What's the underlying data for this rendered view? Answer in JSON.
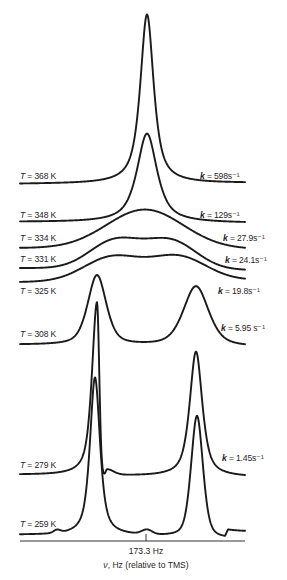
{
  "figure": {
    "background": "#ffffff",
    "line_color": "#1a1a1a"
  },
  "chart_data": {
    "type": "line",
    "subtype": "stacked NMR spectra vs temperature (two-site exchange)",
    "title": "",
    "xlabel_symbol": "ν",
    "xlabel_rest": ", Hz (relative to TMS)",
    "xlabel": "ν, Hz (relative to TMS)",
    "ylabel": "",
    "grid": false,
    "legend": "inline labels (temperature left, rate constant right)",
    "units_note": "x positions and intensities given in figure pixel units (no numeric y axis shown)",
    "x_range_px": [
      20,
      245
    ],
    "x_ticks": [
      {
        "x_px": 146,
        "label": "173.3 Hz"
      }
    ],
    "temperature_symbol": "T",
    "rate_symbol": "k",
    "series": [
      {
        "name": "T = 368 K",
        "T_K": 368,
        "k_s-1": 598,
        "T_label": " = 368 K",
        "k_label": " = 598s⁻¹",
        "baseline": [
          [
            20,
            184
          ],
          [
            245,
            183
          ]
        ],
        "peaks": [
          {
            "x": 147,
            "h": 169,
            "w": 8,
            "eta": 0.8
          }
        ]
      },
      {
        "name": "T = 348 K",
        "T_K": 348,
        "k_s-1": 129,
        "T_label": " = 348 K",
        "k_label": " = 129s⁻¹",
        "baseline": [
          [
            20,
            222
          ],
          [
            245,
            223
          ]
        ],
        "peaks": [
          {
            "x": 147,
            "h": 89,
            "w": 12,
            "eta": 0.8
          }
        ]
      },
      {
        "name": "T = 334 K",
        "T_K": 334,
        "k_s-1": 27.9,
        "T_label": " = 334 K",
        "k_label": " = 27.9s⁻¹",
        "baseline": [
          [
            20,
            248
          ],
          [
            245,
            249
          ]
        ],
        "peaks": [
          {
            "x": 145,
            "h": 39,
            "w": 45,
            "eta": 0
          }
        ]
      },
      {
        "name": "T = 331 K",
        "T_K": 331,
        "k_s-1": 24.1,
        "T_label": " = 331 K",
        "k_label": " = 24.1s⁻¹",
        "baseline": [
          [
            20,
            268
          ],
          [
            245,
            270
          ]
        ],
        "peaks": [
          {
            "x": 115,
            "h": 28,
            "w": 30,
            "eta": 0
          },
          {
            "x": 171,
            "h": 28,
            "w": 30,
            "eta": 0
          }
        ]
      },
      {
        "name": "T = 325 K",
        "T_K": 325,
        "k_s-1": 19.8,
        "T_label": " = 325 K",
        "k_label": " = 19.8s⁻¹",
        "baseline": [
          [
            20,
            282
          ],
          [
            245,
            280
          ]
        ],
        "peaks": [
          {
            "x": 112,
            "h": 24,
            "w": 33,
            "eta": 0
          },
          {
            "x": 178,
            "h": 24,
            "w": 33,
            "eta": 0
          }
        ]
      },
      {
        "name": "T = 308 K",
        "T_K": 308,
        "k_s-1": 5.95,
        "T_label": " = 308 K",
        "k_label": " = 5.95 s⁻¹",
        "baseline": [
          [
            20,
            345
          ],
          [
            245,
            347
          ]
        ],
        "peaks": [
          {
            "x": 97,
            "h": 70,
            "w": 11,
            "eta": 0.5
          },
          {
            "x": 196,
            "h": 60,
            "w": 15,
            "eta": 0.5
          }
        ]
      },
      {
        "name": "T = 279 K",
        "T_K": 279,
        "k_s-1": 1.45,
        "T_label": " = 279 K",
        "k_label": " = 1.45s⁻¹",
        "baseline": [
          [
            20,
            475
          ],
          [
            245,
            477
          ]
        ],
        "peaks": [
          {
            "x": 97,
            "h": 173,
            "wl": 6,
            "wr": 2.6,
            "eta": 0.7,
            "etaR": 0
          },
          {
            "x": 107,
            "h": 6,
            "wl": 1.5,
            "wr": 8,
            "eta": 0.3
          },
          {
            "x": 196,
            "h": 125,
            "w": 7.5,
            "eta": 0.7
          }
        ]
      },
      {
        "name": "T = 259 K",
        "T_K": 259,
        "k_s-1": null,
        "T_label": " = 259 K",
        "k_label": "",
        "baseline": [
          [
            20,
            535
          ],
          [
            140,
            536
          ],
          [
            220,
            539
          ],
          [
            225,
            539
          ],
          [
            228,
            532
          ],
          [
            245,
            532
          ]
        ],
        "peaks": [
          {
            "x": 57,
            "h": 3,
            "w": 4,
            "eta": 0
          },
          {
            "x": 95,
            "h": 158,
            "w": 6,
            "eta": 0.7
          },
          {
            "x": 147,
            "h": 4.5,
            "w": 6,
            "eta": 0
          },
          {
            "x": 197,
            "h": 122,
            "w": 7,
            "eta": 0.4
          }
        ]
      }
    ]
  }
}
